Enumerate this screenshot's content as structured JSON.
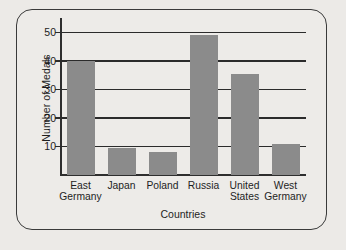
{
  "chart_data": {
    "type": "bar",
    "title": "",
    "xlabel": "Countries",
    "ylabel": "Number of Medals",
    "categories": [
      "East Germany",
      "Japan",
      "Poland",
      "Russia",
      "United States",
      "West Germany"
    ],
    "category_lines": [
      [
        "East",
        "Germany"
      ],
      [
        "Japan"
      ],
      [
        "Poland"
      ],
      [
        "Russia"
      ],
      [
        "United",
        "States"
      ],
      [
        "West",
        "Germany"
      ]
    ],
    "values": [
      40,
      9.5,
      8,
      49,
      35.5,
      11
    ],
    "ylim": [
      0,
      55
    ],
    "yticks": [
      10,
      20,
      30,
      40,
      50
    ],
    "ytick_labels": [
      "10",
      "20",
      "30",
      "40",
      "50"
    ],
    "grid": "horizontal",
    "legend": "none",
    "bar_color": "#8b8b8b",
    "axis_color": "#2b2b2b",
    "background_color": "#eceae7",
    "frame_color": "#3a3a3a"
  }
}
